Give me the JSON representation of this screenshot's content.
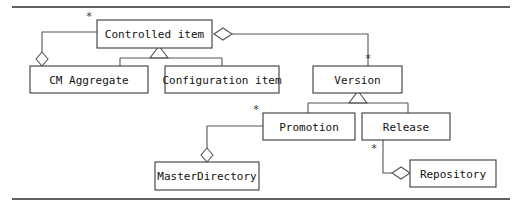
{
  "diagram": {
    "kind": "uml-class-diagram",
    "title": "",
    "colors": {
      "background": "#ffffff",
      "box_fill": "#ffffff",
      "box_stroke": "#3a3a3a",
      "connector_stroke": "#555555",
      "rule_stroke": "#2c2c2c",
      "text": "#111111"
    },
    "rules": [
      {
        "name": "top-rule",
        "x1": 12,
        "y1": 7,
        "x2": 510,
        "y2": 7
      },
      {
        "name": "bottom-rule",
        "x1": 12,
        "y1": 199,
        "x2": 510,
        "y2": 199
      }
    ],
    "classes": [
      {
        "id": "controlled-item",
        "label": "Controlled item",
        "x": 97,
        "y": 20,
        "w": 115,
        "h": 28
      },
      {
        "id": "cm-aggregate",
        "label": "CM Aggregate",
        "x": 30,
        "y": 66,
        "w": 118,
        "h": 27
      },
      {
        "id": "configuration-item",
        "label": "Configuration item",
        "x": 165,
        "y": 66,
        "w": 114,
        "h": 27
      },
      {
        "id": "version",
        "label": "Version",
        "x": 313,
        "y": 66,
        "w": 89,
        "h": 27
      },
      {
        "id": "promotion",
        "label": "Promotion",
        "x": 263,
        "y": 113,
        "w": 92,
        "h": 27
      },
      {
        "id": "release",
        "label": "Release",
        "x": 362,
        "y": 113,
        "w": 88,
        "h": 27
      },
      {
        "id": "master-directory",
        "label": "MasterDirectory",
        "x": 155,
        "y": 162,
        "w": 104,
        "h": 28
      },
      {
        "id": "repository",
        "label": "Repository",
        "x": 410,
        "y": 160,
        "w": 86,
        "h": 27
      }
    ],
    "multiplicities": [
      {
        "id": "mult-controlled-item",
        "label": "*",
        "x": 89,
        "y": 16,
        "relates": "cm-aggregate-owns-controlled-item"
      },
      {
        "id": "mult-version",
        "label": "*",
        "x": 368,
        "y": 58,
        "relates": "controlled-item-owns-version"
      },
      {
        "id": "mult-promotion",
        "label": "*",
        "x": 256,
        "y": 109,
        "relates": "master-directory-owns-promotion"
      },
      {
        "id": "mult-release",
        "label": "*",
        "x": 374,
        "y": 148,
        "relates": "release-owns-repository"
      }
    ],
    "relationships": [
      {
        "id": "cm-aggregate-owns-controlled-item",
        "type": "aggregation",
        "from": "cm-aggregate",
        "to": "controlled-item",
        "multiplicity": "*",
        "diamond_end": "cm-aggregate"
      },
      {
        "id": "controlled-item-owns-version",
        "type": "aggregation",
        "from": "controlled-item",
        "to": "version",
        "multiplicity": "*",
        "diamond_end": "controlled-item"
      },
      {
        "id": "cm-aggregate-generalizes-controlled-item",
        "type": "generalization",
        "from": "cm-aggregate",
        "to": "controlled-item"
      },
      {
        "id": "configuration-item-generalizes-controlled-item",
        "type": "generalization",
        "from": "configuration-item",
        "to": "controlled-item"
      },
      {
        "id": "promotion-generalizes-version",
        "type": "generalization",
        "from": "promotion",
        "to": "version"
      },
      {
        "id": "release-generalizes-version",
        "type": "generalization",
        "from": "release",
        "to": "version"
      },
      {
        "id": "master-directory-owns-promotion",
        "type": "aggregation",
        "from": "master-directory",
        "to": "promotion",
        "multiplicity": "*",
        "diamond_end": "master-directory"
      },
      {
        "id": "release-owns-repository",
        "type": "aggregation",
        "from": "release",
        "to": "repository",
        "multiplicity": "*",
        "diamond_end": "repository"
      }
    ]
  }
}
